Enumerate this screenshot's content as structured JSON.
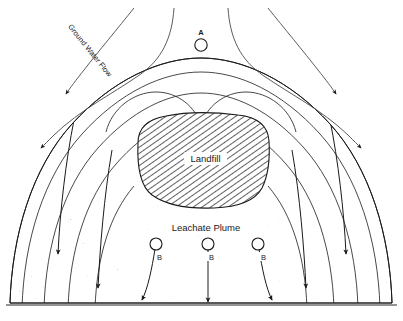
{
  "figure": {
    "background_color": "#ffffff",
    "width": 403,
    "height": 321
  },
  "labels": {
    "ground_water_flow": "Ground Water Flow",
    "landfill": "Landfill",
    "leachate_plume": "Leachate Plume",
    "well_a": "A",
    "well_b_left": "B",
    "well_b_center": "B",
    "well_b_right": "B"
  },
  "colors": {
    "line": "#1a1a1a",
    "plume_fill": "#9a9a9a",
    "landfill_hatch": "#2b2b2b",
    "landfill_fill": "#ffffff",
    "text": "#1a1a1a"
  },
  "elements": {
    "wells": [
      {
        "id": "A",
        "label": "A",
        "type": "upgradient-monitoring-well"
      },
      {
        "id": "B1",
        "label": "B",
        "type": "downgradient-monitoring-well"
      },
      {
        "id": "B2",
        "label": "B",
        "type": "downgradient-monitoring-well"
      },
      {
        "id": "B3",
        "label": "B",
        "type": "downgradient-monitoring-well"
      }
    ],
    "flow_arrow_count": 4,
    "plume_arrow_count": 5,
    "contour_count": 5
  }
}
